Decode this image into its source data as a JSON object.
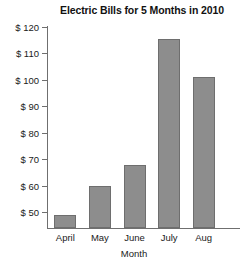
{
  "chart_data": {
    "type": "bar",
    "title": "Electric Bills for 5 Months in 2010",
    "xlabel": "Month",
    "ylabel": "",
    "categories": [
      "April",
      "May",
      "June",
      "July",
      "Aug"
    ],
    "values": [
      49,
      60,
      68,
      115.5,
      101
    ],
    "ytick_labels": [
      "$ 120",
      "$ 110",
      "$ 100",
      "$ 90",
      "$ 80",
      "$ 70",
      "$ 60",
      "$ 50"
    ],
    "ytick_values": [
      120,
      110,
      100,
      90,
      80,
      70,
      60,
      50
    ],
    "ylim": [
      44,
      120
    ],
    "grid": false,
    "legend": false,
    "bar_color": "#8d8d8d",
    "bar_edge_color": "#6e6e6e",
    "axis_color": "#6f6f6f"
  }
}
